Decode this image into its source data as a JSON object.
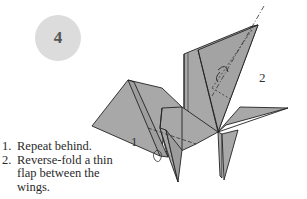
{
  "step": {
    "number": "4",
    "badge_color": "#dcdcdc"
  },
  "callouts": {
    "one": "1",
    "two": "2"
  },
  "instructions": [
    {
      "marker": "1.",
      "text": "Repeat behind."
    },
    {
      "marker": "2.",
      "text": "Reverse-fold a thin flap between the wings."
    }
  ],
  "colors": {
    "paper": "#a8a8a8",
    "edge": "#222222",
    "background": "#ffffff"
  }
}
